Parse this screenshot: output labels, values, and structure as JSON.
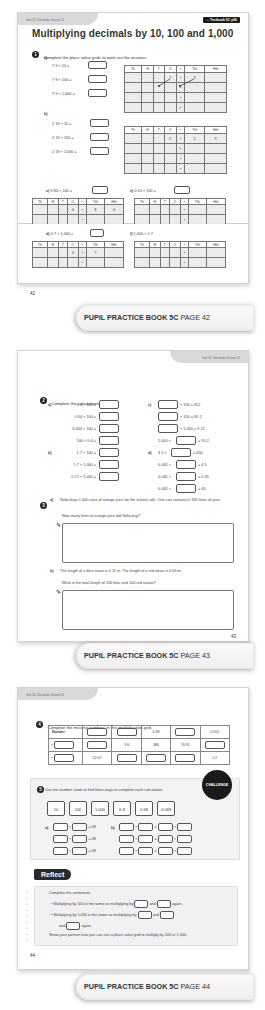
{
  "pages": [
    {
      "unit_label": "Unit 12: Decimals, lesson 12",
      "textbook_badge": "→ Textbook 5C p56",
      "title": "Multiplying decimals by 10, 100 and 1,000",
      "page_number": "42",
      "footer": {
        "book": "PUPIL PRACTICE BOOK 5C",
        "page": "PAGE 42"
      },
      "q1": {
        "number": "1",
        "text": "Complete the place value grids to work out the answers.",
        "pv_headers": [
          "Th",
          "H",
          "T",
          "O",
          "•",
          "Tth",
          "Hth"
        ],
        "a": {
          "label": "a)",
          "calcs": [
            "7·9 × 10",
            "7·9 × 100",
            "7·9 × 1,000"
          ],
          "first_row": [
            "",
            "",
            "",
            "7",
            "•",
            "9",
            ""
          ]
        },
        "b": {
          "label": "b)",
          "calcs": [
            "2·19 × 10",
            "2·19 × 100",
            "2·19 × 1,000"
          ],
          "first_row": [
            "",
            "",
            "",
            "2",
            "•",
            "1",
            "9"
          ]
        },
        "c": {
          "label": "c)",
          "calc": "0·84 × 100",
          "first_row": [
            "",
            "",
            "",
            "0",
            "•",
            "8",
            "4"
          ]
        },
        "d": {
          "label": "d)",
          "calc": "0·7 × 1,000",
          "first_row": [
            "",
            "",
            "",
            "0",
            "•",
            "7",
            ""
          ]
        },
        "e": {
          "label": "e)",
          "calc": "0·05 × 100",
          "first_row": [
            "",
            "",
            "",
            "",
            "•",
            "",
            ""
          ]
        },
        "f": {
          "label": "f)",
          "calc": "1,000 × 1·7",
          "first_row": [
            "",
            "",
            "",
            "",
            "•",
            "",
            ""
          ]
        }
      }
    },
    {
      "unit_label": "Unit 12: Decimals, lesson 12",
      "page_number": "43",
      "footer": {
        "book": "PUPIL PRACTICE BOOK 5C",
        "page": "PAGE 43"
      },
      "q2": {
        "number": "2",
        "text": "Complete the calculations.",
        "a": {
          "label": "a)",
          "items": [
            "0·4 × 100 =",
            "0·04 × 100 =",
            "0·004 × 100 =",
            "100 × 0·4 ="
          ]
        },
        "b": {
          "label": "b)",
          "items": [
            "1·7 × 100 =",
            "1·7 × 1,000 =",
            "0·17 × 1,000 ="
          ]
        },
        "c": {
          "label": "c)",
          "items": [
            {
              "pre": "",
              "post": "× 100 = 912"
            },
            {
              "pre": "",
              "post": "× 100 = 91·2"
            },
            {
              "pre": "",
              "post": "× 1,000 = 9·12"
            },
            {
              "pre": "1,000 ×",
              "post": "= 91·2"
            }
          ]
        },
        "d": {
          "label": "d)",
          "items": [
            {
              "pre": "4·5 ×",
              "post": "= 450"
            },
            {
              "pre": "0·045 ×",
              "post": "= 4.5"
            },
            {
              "pre": "0·045 ×",
              "post": "= 0·45"
            },
            {
              "pre": "0·045 ×",
              "post": "= 45"
            }
          ]
        }
      },
      "q3": {
        "number": "3",
        "a_label": "a)",
        "a_text": "Sofia buys 1,000 cans of orange juice for the school café. One can contains 0·335 litres of juice.",
        "a_question": "How many litres of orange juice did Sofia buy?",
        "b_label": "b)",
        "b_text": "The length of a blue straw is 0·11 m. The length of a red straw is 0·09 m.",
        "b_question": "What is the total length of 100 blue and 100 red straws?"
      }
    },
    {
      "unit_label": "Unit 12: Decimals, lesson 12",
      "page_number": "44",
      "footer": {
        "book": "PUPIL PRACTICE BOOK 5C",
        "page": "PAGE 44"
      },
      "q4": {
        "number": "4",
        "text": "Complete the missing numbers in this multiplication grid.",
        "rows": [
          [
            "Number",
            "[ ]",
            "[ ]",
            "0·38",
            "[ ]",
            "0·012"
          ],
          [
            "× [ ]",
            "[ ]",
            "3·6",
            "380",
            "76·91",
            "[ ]"
          ],
          [
            "× [ ]",
            "12·07",
            "[ ]",
            "[ ]",
            "[ ]",
            "1·2"
          ]
        ]
      },
      "q5": {
        "number": "5",
        "text": "Use the number cards to find three ways to complete each calculation.",
        "cards": [
          "10",
          "100",
          "1,000",
          "6·8",
          "0·68",
          "0·068"
        ],
        "a_label": "a)",
        "a_result": "= 68",
        "b_label": "b)",
        "challenge_label": "CHALLENGE"
      },
      "reflect": {
        "title": "Reflect",
        "intro": "Complete the sentences:",
        "bullet1": [
          "Multiplying by 100 is the same as multiplying by",
          "and",
          "again."
        ],
        "bullet2": [
          "Multiplying by 1,000 is the same as multiplying by",
          "and",
          "and",
          "again."
        ],
        "outro": "Show your partner how you can use a place value grid to multiply by 100 or 1,000."
      }
    }
  ]
}
